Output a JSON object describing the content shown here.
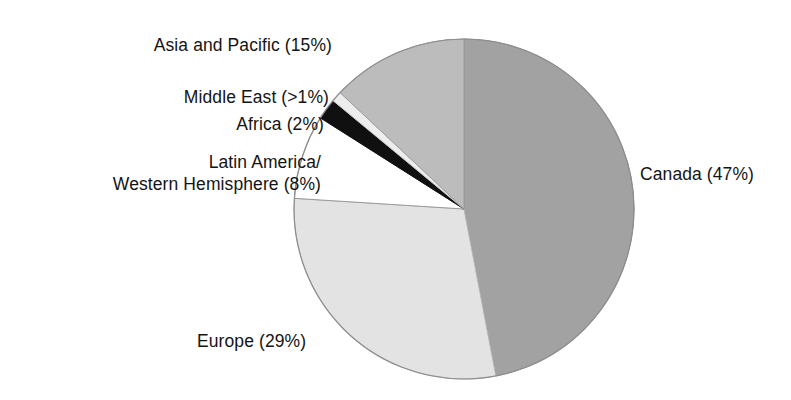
{
  "chart_data": {
    "type": "pie",
    "title": "",
    "subtitle": "",
    "xlabel": "",
    "ylabel": "",
    "legend_position": "none",
    "grid": false,
    "start_angle_deg": 0,
    "direction": "clockwise",
    "center": {
      "x": 464,
      "y": 209
    },
    "radius": 170,
    "categories": [
      "Canada",
      "Europe",
      "Latin America/Western Hemisphere",
      "Africa",
      "Middle East",
      "Asia and Pacific"
    ],
    "values": [
      47,
      29,
      8,
      2,
      0.8,
      15
    ],
    "value_labels": [
      "47%",
      "29%",
      "8%",
      "2%",
      ">1%",
      "15%"
    ],
    "slices": [
      {
        "name": "Canada",
        "label": "Canada (47%)",
        "value": 47,
        "value_label": "47%",
        "color": "#a2a2a2",
        "stroke": "#8d8d8d",
        "start_deg": 0,
        "end_deg": 169.2
      },
      {
        "name": "Europe",
        "label": "Europe (29%)",
        "value": 29,
        "value_label": "29%",
        "color": "#e3e3e3",
        "stroke": "#b6b6b6",
        "start_deg": 169.2,
        "end_deg": 273.6
      },
      {
        "name": "Latin America/Western Hemisphere",
        "label": "Latin America/ Western Hemisphere (8%)",
        "label_line1": "Latin America/",
        "label_line2": "Western Hemisphere (8%)",
        "value": 8,
        "value_label": "8%",
        "color": "#ffffff",
        "stroke": "#9a9a9a",
        "start_deg": 273.6,
        "end_deg": 302.4
      },
      {
        "name": "Africa",
        "label": "Africa (2%)",
        "value": 2,
        "value_label": "2%",
        "color": "#101010",
        "stroke": "#101010",
        "start_deg": 302.4,
        "end_deg": 309.6
      },
      {
        "name": "Middle East",
        "label": "Middle East (>1%)",
        "value": 0.8,
        "value_label": ">1%",
        "color": "#ededed",
        "stroke": "#c4c4c4",
        "start_deg": 309.6,
        "end_deg": 313.2
      },
      {
        "name": "Asia and Pacific",
        "label": "Asia and Pacific (15%)",
        "value": 15,
        "value_label": "15%",
        "color": "#bcbcbc",
        "stroke": "#9e9e9e",
        "start_deg": 313.2,
        "end_deg": 360
      }
    ]
  },
  "labels": {
    "asia_pacific": "Asia and Pacific (15%)",
    "middle_east": "Middle East (>1%)",
    "africa": "Africa (2%)",
    "latin_america_line1": "Latin America/",
    "latin_america_line2": "Western Hemisphere (8%)",
    "canada": "Canada (47%)",
    "europe": "Europe (29%)"
  },
  "colors": {
    "canada": "#a2a2a2",
    "europe": "#e3e3e3",
    "latin_america": "#ffffff",
    "africa": "#101010",
    "middle_east": "#ededed",
    "asia_pacific": "#bcbcbc",
    "background": "#ffffff",
    "text": "#141414"
  }
}
